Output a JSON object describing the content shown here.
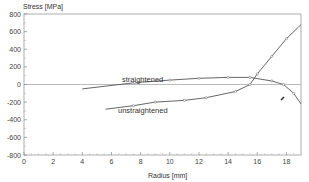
{
  "chart_data": {
    "type": "line",
    "title": "",
    "xlabel": "Radius [mm]",
    "ylabel": "Stress [MPa]",
    "xlim": [
      0,
      19
    ],
    "ylim": [
      -800,
      800
    ],
    "xticks": [
      0,
      2,
      4,
      6,
      8,
      10,
      12,
      14,
      16,
      18
    ],
    "yticks": [
      800,
      600,
      400,
      200,
      0,
      -200,
      -400,
      -600,
      -800
    ],
    "grid": false,
    "zero_line": true,
    "series": [
      {
        "name": "straightened",
        "x": [
          4,
          7.6,
          10,
          12,
          14,
          15.5,
          17,
          17.8,
          18.5,
          19
        ],
        "y": [
          -50,
          20,
          50,
          70,
          80,
          80,
          40,
          0,
          -100,
          -220
        ]
      },
      {
        "name": "unstraightened",
        "x": [
          5.6,
          7.5,
          9,
          11,
          12.5,
          14.5,
          15.5,
          16,
          17,
          18,
          19
        ],
        "y": [
          -280,
          -240,
          -200,
          -180,
          -150,
          -80,
          0,
          120,
          320,
          520,
          680
        ]
      }
    ],
    "annotations": [
      "straightened",
      "unstraightened"
    ]
  },
  "labels": {
    "ylabel": "Stress [MPa]",
    "xlabel": "Radius [mm]",
    "straightened": "straightened",
    "unstraightened": "unstraightened"
  }
}
